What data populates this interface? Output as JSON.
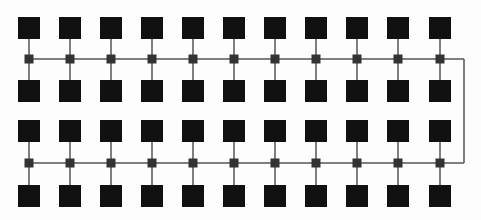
{
  "diagram": {
    "type": "network-topology",
    "columns": 11,
    "column_x": [
      29,
      70,
      111,
      152,
      193,
      234,
      275,
      316,
      357,
      398,
      440
    ],
    "node_rows_y": [
      28,
      91,
      131,
      196
    ],
    "switch_rows_y": [
      59,
      163
    ],
    "node_size": 22,
    "switch_size": 9,
    "right_link_x": 464,
    "colors": {
      "node": "#111111",
      "switch": "#333333",
      "line": "#555555",
      "background": "#fdfdfd"
    }
  }
}
